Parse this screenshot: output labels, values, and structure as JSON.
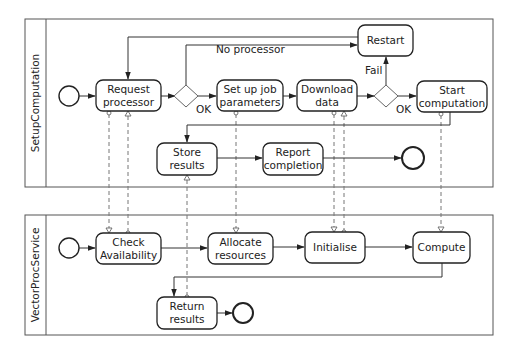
{
  "pools": [
    {
      "name": "SetupComputation"
    },
    {
      "name": "VectorProcService"
    }
  ],
  "setup": {
    "request_processor": [
      "Request",
      "processor"
    ],
    "setup_job": [
      "Set up job",
      "parameters"
    ],
    "download_data": [
      "Download",
      "data"
    ],
    "start_computation": [
      "Start",
      "computation"
    ],
    "restart": "Restart",
    "store_results": [
      "Store",
      "results"
    ],
    "report_completion": [
      "Report",
      "completion"
    ]
  },
  "service": {
    "check_availability": [
      "Check",
      "Availability"
    ],
    "allocate_resources": [
      "Allocate",
      "resources"
    ],
    "initialise": "Initialise",
    "compute": "Compute",
    "return_results": [
      "Return",
      "results"
    ]
  },
  "edge_labels": {
    "no_processor": "No processor",
    "ok1": "OK",
    "fail": "Fail",
    "ok2": "OK"
  },
  "colors": {
    "stroke": "#222222",
    "pool_border": "#555555",
    "message_flow": "#777777",
    "background": "#ffffff"
  }
}
